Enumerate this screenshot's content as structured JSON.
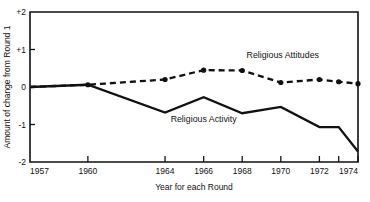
{
  "chart_data": {
    "type": "line",
    "title": "",
    "xlabel": "Year for each Round",
    "ylabel": "Amount of change from Round 1",
    "xlim": [
      1957,
      1974
    ],
    "ylim": [
      -2,
      2
    ],
    "grid": false,
    "legend_position": "inline-annotation",
    "x_tick_labels": [
      "1957",
      "1960",
      "1964",
      "1966",
      "1968",
      "1970",
      "1972",
      "1974"
    ],
    "x_tick_values": [
      1957,
      1960,
      1964,
      1966,
      1968,
      1970,
      1972,
      1974
    ],
    "extra_x_ticks": [
      1973
    ],
    "y_tick_labels": [
      "+2",
      "+1",
      "0",
      "-1",
      "-2"
    ],
    "y_tick_values": [
      2,
      1,
      0,
      -1,
      -2
    ],
    "series": [
      {
        "name": "Religious Attitudes",
        "style": "dashed",
        "x": [
          1957,
          1960,
          1964,
          1966,
          1968,
          1970,
          1972,
          1973,
          1974
        ],
        "values": [
          0.0,
          0.06,
          0.2,
          0.45,
          0.44,
          0.12,
          0.2,
          0.14,
          0.09
        ],
        "marker_x": [
          1960,
          1964,
          1966,
          1968,
          1970,
          1972,
          1973,
          1974
        ],
        "marker_values": [
          0.06,
          0.2,
          0.45,
          0.44,
          0.12,
          0.2,
          0.14,
          0.09
        ]
      },
      {
        "name": "Religious Activity",
        "style": "solid",
        "x": [
          1957,
          1960,
          1964,
          1966,
          1968,
          1970,
          1972,
          1973,
          1974
        ],
        "values": [
          0.0,
          0.06,
          -0.68,
          -0.27,
          -0.7,
          -0.53,
          -1.07,
          -1.07,
          -1.72
        ],
        "marker_x": [],
        "marker_values": []
      }
    ],
    "annotations": [
      {
        "text": "Religious  Attitudes",
        "x": 1970.1,
        "y": 0.78
      },
      {
        "text": "Religious Activity",
        "x": 1966.0,
        "y": -0.92
      }
    ]
  }
}
